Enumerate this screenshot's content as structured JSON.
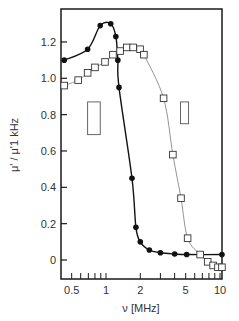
{
  "chart_data": {
    "type": "scatter",
    "title": "",
    "xlabel": "ν [MHz]",
    "ylabel": "μ' / μ'1 kHz",
    "xscale": "log",
    "xlim": [
      0.4,
      10.4
    ],
    "ylim": [
      -0.05,
      1.35
    ],
    "grid": false,
    "legend": "none",
    "x_ticks": [
      0.5,
      1,
      2,
      5,
      10
    ],
    "x_tick_labels": [
      "0.5",
      "1",
      "2",
      "5",
      "10"
    ],
    "y_ticks": [
      0,
      0.2,
      0.4,
      0.6,
      0.8,
      1.0,
      1.2
    ],
    "y_tick_labels": [
      "0",
      "0.2",
      "0.4",
      "0.6",
      "0.8",
      "1.0",
      "1.2"
    ],
    "series": [
      {
        "name": "filled circles",
        "marker": "filled-circle",
        "line": "solid dark",
        "x": [
          0.43,
          0.69,
          0.89,
          1.1,
          1.22,
          1.27,
          1.3,
          1.69,
          1.83,
          2.0,
          2.4,
          3.0,
          4.0,
          5.1,
          10.4
        ],
        "values": [
          1.1,
          1.16,
          1.29,
          1.3,
          1.23,
          1.1,
          0.95,
          0.45,
          0.18,
          0.1,
          0.055,
          0.04,
          0.033,
          0.03,
          0.03
        ]
      },
      {
        "name": "open squares",
        "marker": "open-square",
        "line": "thin gray",
        "x": [
          0.43,
          0.57,
          0.69,
          0.8,
          0.98,
          1.15,
          1.33,
          1.52,
          1.73,
          1.99,
          2.15,
          3.2,
          3.86,
          4.55,
          5.2,
          6.7,
          7.8,
          8.7,
          9.6,
          10.4
        ],
        "values": [
          0.96,
          0.99,
          1.03,
          1.06,
          1.09,
          1.13,
          1.15,
          1.17,
          1.17,
          1.16,
          1.13,
          0.89,
          0.58,
          0.34,
          0.12,
          0.03,
          -0.01,
          -0.03,
          -0.04,
          -0.04
        ]
      }
    ],
    "annotations": [
      {
        "type": "rectangle",
        "x_range": [
          0.69,
          0.89
        ],
        "y_range": [
          0.69,
          0.87
        ]
      },
      {
        "type": "rectangle",
        "x_range": [
          4.5,
          5.3
        ],
        "y_range": [
          0.75,
          0.87
        ]
      }
    ]
  }
}
